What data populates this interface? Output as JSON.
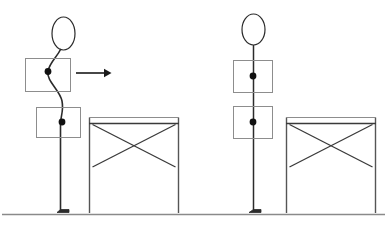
{
  "figure": {
    "type": "line-diagram",
    "width": 387,
    "height": 229,
    "background_color": "#ffffff",
    "stroke_color": "#2b2b2b",
    "thin_stroke_color": "#6a6a6a",
    "node_fill_color": "#111111",
    "ground_color": "#8a8a8a"
  },
  "panels": [
    {
      "id": "left-panel",
      "name": "deformed-state",
      "caption": "",
      "mast": {
        "name": "flexible-mast-deformed",
        "deformed": true,
        "head": {
          "name": "mast-head-ellipse",
          "cx": 63.5,
          "cy": 33.5,
          "rx": 11.5,
          "ry": 16.5
        },
        "spine_path": "M 60 49 C 57 58, 50 62, 48 71 C 46 81, 60 90, 62 101 C 64 112, 60 116, 60 124 L 60 213",
        "nodes": [
          {
            "name": "mass-node-upper",
            "cx": 48,
            "cy": 71.5,
            "r": 3.4
          },
          {
            "name": "mass-node-lower",
            "cx": 62,
            "cy": 122,
            "r": 3.4
          }
        ],
        "foot": {
          "name": "mast-base-foot",
          "x": 57,
          "y": 209,
          "w": 11,
          "h": 4
        }
      },
      "boxes": [
        {
          "name": "mass-box-upper",
          "x": 25,
          "y": 58,
          "w": 45,
          "h": 33
        },
        {
          "name": "mass-box-lower",
          "x": 36,
          "y": 107,
          "w": 44,
          "h": 30
        }
      ],
      "arrow": {
        "name": "displacement-arrow",
        "label": "",
        "x1": 76,
        "y1": 73,
        "x2": 110,
        "y2": 73,
        "head_size": 6
      },
      "frame": {
        "name": "braced-frame-left",
        "x": 89,
        "y": 117,
        "w": 89,
        "h": 96,
        "top_beam_y": 123,
        "brace_inset_left": 3,
        "brace_top_y": 124,
        "brace_bottom_y": 167,
        "braces": 2
      }
    },
    {
      "id": "right-panel",
      "name": "undeformed-state",
      "caption": "",
      "mast": {
        "name": "flexible-mast-straight",
        "deformed": false,
        "head": {
          "name": "mast-head-ellipse",
          "cx": 253.5,
          "cy": 29.5,
          "rx": 11.5,
          "ry": 15.5
        },
        "spine_path": "M 253 45 L 253 213",
        "nodes": [
          {
            "name": "mass-node-upper",
            "cx": 253,
            "cy": 76,
            "r": 3.4
          },
          {
            "name": "mass-node-lower",
            "cx": 253,
            "cy": 122,
            "r": 3.4
          }
        ],
        "foot": {
          "name": "mast-base-foot",
          "x": 249,
          "y": 209,
          "w": 11,
          "h": 4
        }
      },
      "boxes": [
        {
          "name": "mass-box-upper",
          "x": 233,
          "y": 60,
          "w": 39,
          "h": 32
        },
        {
          "name": "mass-box-lower",
          "x": 233,
          "y": 106,
          "w": 39,
          "h": 32
        }
      ],
      "arrow": null,
      "frame": {
        "name": "braced-frame-right",
        "x": 286,
        "y": 117,
        "w": 89,
        "h": 96,
        "top_beam_y": 123,
        "brace_inset_left": 3,
        "brace_top_y": 124,
        "brace_bottom_y": 167,
        "braces": 2
      }
    }
  ],
  "ground": {
    "name": "ground-line",
    "x1": 2,
    "x2": 385,
    "y": 214
  }
}
